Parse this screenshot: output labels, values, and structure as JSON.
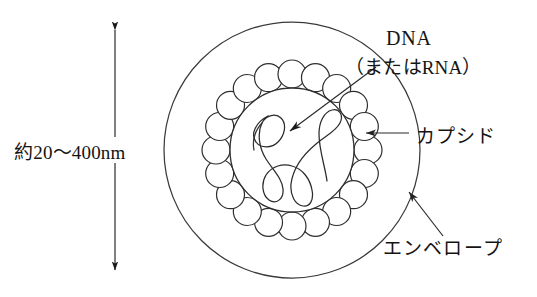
{
  "figure": {
    "background_color": "#ffffff",
    "stroke_color": "#333333",
    "text_color": "#141414"
  },
  "labels": {
    "size": "約20〜400nm",
    "dna_main": "DNA",
    "dna_alt": "（またはRNA）",
    "capsid": "カプシド",
    "envelope": "エンベロープ"
  },
  "structures": {
    "envelope": {
      "name": "エンベロープ",
      "shape": "circle",
      "center": [
        292,
        150
      ],
      "radius": 128
    },
    "capsid": {
      "name": "カプシド",
      "shape": "ring-of-circles",
      "center": [
        292,
        150
      ],
      "ring_radius": 76,
      "subunit_radius": 14,
      "subunit_count": 20
    },
    "core": {
      "name": "core",
      "shape": "circle",
      "center": [
        292,
        150
      ],
      "radius": 62
    },
    "nucleic_acid": {
      "name": "DNA（またはRNA）",
      "shape": "coiled-strand"
    }
  },
  "annotations": {
    "size_arrow": {
      "name": "約20〜400nm",
      "orientation": "vertical",
      "double_headed": true,
      "x": 115,
      "y_top": 22,
      "y_bottom": 278,
      "gap_top": 137,
      "gap_bottom": 163
    },
    "dna_leader": {
      "from": [
        376,
        67
      ],
      "to": [
        286,
        134
      ]
    },
    "capsid_leader": {
      "from": [
        407,
        133
      ],
      "to": [
        362,
        133
      ]
    },
    "envelope_leader": {
      "from": [
        443,
        236
      ],
      "to": [
        406,
        189
      ]
    }
  }
}
